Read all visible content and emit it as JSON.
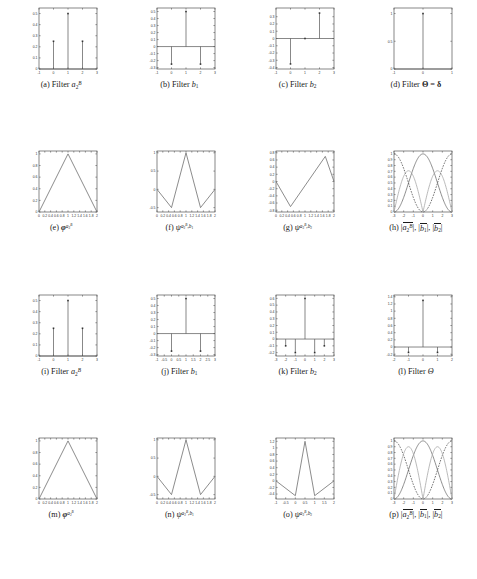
{
  "figure": {
    "rows": 4,
    "cols": 4,
    "colors": {
      "axis": "#555555",
      "stem": "#555555",
      "marker": "#333333",
      "curve_solid": "#6f6f6f",
      "curve_dashed": "#4a4a4a",
      "curve_light": "#a8a8a8",
      "background": "#ffffff"
    }
  },
  "chart_data": [
    {
      "id": "a",
      "type": "bar",
      "plot_style": "stem",
      "title": "",
      "caption_label": "(a)",
      "caption_text": "Filter a_2^B",
      "xlabel": "",
      "ylabel": "",
      "xlim": [
        -1,
        3
      ],
      "ylim": [
        0,
        0.55
      ],
      "xticks": [
        -1,
        0,
        1,
        2,
        3
      ],
      "xticklabels": [
        "-1",
        "0",
        "1",
        "2",
        "3"
      ],
      "yticks": [
        0,
        0.1,
        0.2,
        0.3,
        0.4,
        0.5
      ],
      "yticklabels": [
        "0",
        "0.1",
        "0.2",
        "0.3",
        "0.4",
        "0.5"
      ],
      "x": [
        0,
        1,
        2
      ],
      "values": [
        0.25,
        0.5,
        0.25
      ],
      "grid": false
    },
    {
      "id": "b",
      "type": "bar",
      "plot_style": "stem",
      "caption_label": "(b)",
      "caption_text": "Filter b_1",
      "xlim": [
        -1,
        3
      ],
      "ylim": [
        -0.32,
        0.55
      ],
      "xticks": [
        -1,
        0,
        1,
        2,
        3
      ],
      "xticklabels": [
        "-1",
        "0",
        "1",
        "2",
        "3"
      ],
      "yticks": [
        -0.3,
        -0.2,
        -0.1,
        0,
        0.1,
        0.2,
        0.3,
        0.4,
        0.5
      ],
      "yticklabels": [
        "-0.3",
        "-0.2",
        "-0.1",
        "0",
        "0.1",
        "0.2",
        "0.3",
        "0.4",
        "0.5"
      ],
      "x": [
        0,
        1,
        2
      ],
      "values": [
        -0.25,
        0.5,
        -0.25
      ],
      "grid": false
    },
    {
      "id": "c",
      "type": "bar",
      "plot_style": "stem",
      "caption_label": "(c)",
      "caption_text": "Filter b_2",
      "xlim": [
        -1,
        3
      ],
      "ylim": [
        -0.42,
        0.42
      ],
      "xticks": [
        -1,
        0,
        1,
        2,
        3
      ],
      "xticklabels": [
        "-1",
        "0",
        "1",
        "2",
        "3"
      ],
      "yticks": [
        -0.4,
        -0.3,
        -0.2,
        -0.1,
        0,
        0.1,
        0.2,
        0.3
      ],
      "yticklabels": [
        "-0.4",
        "-0.3",
        "-0.2",
        "-0.1",
        "0",
        "0.1",
        "0.2",
        "0.3"
      ],
      "x": [
        0,
        1,
        2
      ],
      "values": [
        -0.35,
        0,
        0.35
      ],
      "grid": false
    },
    {
      "id": "d",
      "type": "bar",
      "plot_style": "stem",
      "caption_label": "(d)",
      "caption_text": "Filter Theta = delta",
      "xlim": [
        -1,
        1
      ],
      "ylim": [
        0,
        1.1
      ],
      "xticks": [
        -1,
        0,
        1
      ],
      "xticklabels": [
        "-1",
        "0",
        "1"
      ],
      "yticks": [
        0,
        0.5,
        1
      ],
      "yticklabels": [
        "0",
        "0.5",
        "1"
      ],
      "x": [
        0
      ],
      "values": [
        1
      ],
      "grid": false
    },
    {
      "id": "e",
      "type": "line",
      "plot_style": "line",
      "caption_label": "(e)",
      "caption_text": "phi^{a_2^B}",
      "xlim": [
        0,
        2
      ],
      "ylim": [
        0,
        1.05
      ],
      "xticks": [
        0,
        0.2,
        0.4,
        0.6,
        0.8,
        1,
        1.2,
        1.4,
        1.6,
        1.8,
        2
      ],
      "xticklabels": [
        "0",
        "0.2",
        "0.4",
        "0.6",
        "0.8",
        "1",
        "1.2",
        "1.4",
        "1.6",
        "1.8",
        "2"
      ],
      "yticks": [
        0,
        0.2,
        0.4,
        0.6,
        0.8,
        1
      ],
      "yticklabels": [
        "0",
        "0.2",
        "0.4",
        "0.6",
        "0.8",
        "1"
      ],
      "x": [
        0,
        1,
        2
      ],
      "values": [
        0,
        1,
        0
      ],
      "grid": false
    },
    {
      "id": "f",
      "type": "line",
      "plot_style": "line",
      "caption_label": "(f)",
      "caption_text": "psi^{a_2^B, b_1}",
      "xlim": [
        0,
        2
      ],
      "ylim": [
        -0.62,
        1.05
      ],
      "xticks": [
        0,
        0.2,
        0.4,
        0.6,
        0.8,
        1,
        1.2,
        1.4,
        1.6,
        1.8,
        2
      ],
      "xticklabels": [
        "0",
        "0.2",
        "0.4",
        "0.6",
        "0.8",
        "1",
        "1.2",
        "1.4",
        "1.6",
        "1.8",
        "2"
      ],
      "yticks": [
        -0.5,
        0,
        0.5,
        1
      ],
      "yticklabels": [
        "-0.5",
        "0",
        "0.5",
        "1"
      ],
      "x": [
        0,
        0.5,
        1,
        1.5,
        2
      ],
      "values": [
        0,
        -0.5,
        1,
        -0.5,
        0
      ],
      "grid": false
    },
    {
      "id": "g",
      "type": "line",
      "plot_style": "line",
      "caption_label": "(g)",
      "caption_text": "psi^{a_2^B, b_2}",
      "xlim": [
        0,
        2
      ],
      "ylim": [
        -0.85,
        0.85
      ],
      "xticks": [
        0,
        0.2,
        0.4,
        0.6,
        0.8,
        1,
        1.2,
        1.4,
        1.6,
        1.8,
        2
      ],
      "xticklabels": [
        "0",
        "0.2",
        "0.4",
        "0.6",
        "0.8",
        "1",
        "1.2",
        "1.4",
        "1.6",
        "1.8",
        "2"
      ],
      "yticks": [
        -0.8,
        -0.6,
        -0.4,
        -0.2,
        0,
        0.2,
        0.4,
        0.6,
        0.8
      ],
      "yticklabels": [
        "-0.8",
        "-0.6",
        "-0.4",
        "-0.2",
        "0",
        "0.2",
        "0.4",
        "0.6",
        "0.8"
      ],
      "x": [
        0,
        0.5,
        1.7,
        2
      ],
      "values": [
        0,
        -0.7,
        0.7,
        0
      ],
      "grid": false
    },
    {
      "id": "h",
      "type": "line",
      "plot_style": "freq",
      "caption_label": "(h)",
      "caption_text": "|a_2^B|, |b_1|, |b_2|",
      "xlim": [
        -3,
        3
      ],
      "ylim": [
        0,
        1.05
      ],
      "xticks": [
        -3,
        -2,
        -1,
        0,
        1,
        2,
        3
      ],
      "xticklabels": [
        "-3",
        "-2",
        "-1",
        "0",
        "1",
        "2",
        "3"
      ],
      "yticks": [
        0,
        0.1,
        0.2,
        0.3,
        0.4,
        0.5,
        0.6,
        0.7,
        0.8,
        0.9,
        1
      ],
      "yticklabels": [
        "0",
        "0.1",
        "0.2",
        "0.3",
        "0.4",
        "0.5",
        "0.6",
        "0.7",
        "0.8",
        "0.9",
        "1"
      ],
      "series": [
        {
          "name": "|a_2^B|",
          "style": "solid",
          "color": "#6f6f6f",
          "fn": "cos2",
          "period": 6.2832,
          "peak_at": 0,
          "amp": 1
        },
        {
          "name": "|b_1|",
          "style": "dashed",
          "color": "#4a4a4a",
          "fn": "sin2",
          "period": 6.2832,
          "peak_at": 3,
          "amp": 1
        },
        {
          "name": "|b_2|",
          "style": "solid-light",
          "color": "#a8a8a8",
          "fn": "sin_abs",
          "period": 3.1416,
          "peak_at": 1.5708,
          "amp": 0.71
        }
      ],
      "grid": false
    },
    {
      "id": "i",
      "type": "bar",
      "plot_style": "stem",
      "caption_label": "(i)",
      "caption_text": "Filter a_2^B",
      "xlim": [
        -1,
        3
      ],
      "ylim": [
        0,
        0.55
      ],
      "xticks": [
        -1,
        0,
        1,
        2,
        3
      ],
      "xticklabels": [
        "-1",
        "0",
        "1",
        "2",
        "3"
      ],
      "yticks": [
        0,
        0.1,
        0.2,
        0.3,
        0.4,
        0.5
      ],
      "yticklabels": [
        "0",
        "0.1",
        "0.2",
        "0.3",
        "0.4",
        "0.5"
      ],
      "x": [
        0,
        1,
        2
      ],
      "values": [
        0.25,
        0.5,
        0.25
      ],
      "grid": false
    },
    {
      "id": "j",
      "type": "bar",
      "plot_style": "stem",
      "caption_label": "(j)",
      "caption_text": "Filter b_1",
      "xlim": [
        -1,
        3
      ],
      "ylim": [
        -0.32,
        0.55
      ],
      "xticks": [
        -1,
        -0.5,
        0,
        0.5,
        1,
        1.5,
        2,
        2.5,
        3
      ],
      "xticklabels": [
        "-1",
        "-0.5",
        "0",
        "0.5",
        "1",
        "1.5",
        "2",
        "2.5",
        "3"
      ],
      "yticks": [
        -0.3,
        -0.2,
        -0.1,
        0,
        0.1,
        0.2,
        0.3,
        0.4,
        0.5
      ],
      "yticklabels": [
        "-0.3",
        "-0.2",
        "-0.1",
        "0",
        "0.1",
        "0.2",
        "0.3",
        "0.4",
        "0.5"
      ],
      "x": [
        0,
        1,
        2
      ],
      "values": [
        -0.25,
        0.5,
        -0.25
      ],
      "grid": false
    },
    {
      "id": "k",
      "type": "bar",
      "plot_style": "stem",
      "caption_label": "(k)",
      "caption_text": "Filter b_2",
      "xlim": [
        -3,
        3
      ],
      "ylim": [
        -0.25,
        0.65
      ],
      "xticks": [
        -3,
        -2,
        -1,
        0,
        1,
        2,
        3
      ],
      "xticklabels": [
        "-3",
        "-2",
        "-1",
        "0",
        "1",
        "2",
        "3"
      ],
      "yticks": [
        -0.2,
        -0.1,
        0,
        0.1,
        0.2,
        0.3,
        0.4,
        0.5,
        0.6
      ],
      "yticklabels": [
        "-0.2",
        "-0.1",
        "0",
        "0.1",
        "0.2",
        "0.3",
        "0.4",
        "0.5",
        "0.6"
      ],
      "x": [
        -2,
        -1,
        0,
        1,
        2
      ],
      "values": [
        -0.1,
        -0.2,
        0.6,
        -0.2,
        -0.1
      ],
      "grid": false
    },
    {
      "id": "l",
      "type": "bar",
      "plot_style": "stem",
      "caption_label": "(l)",
      "caption_text": "Filter Theta",
      "xlim": [
        -2,
        2
      ],
      "ylim": [
        -0.25,
        1.45
      ],
      "xticks": [
        -2,
        -1,
        0,
        1,
        2
      ],
      "xticklabels": [
        "-2",
        "-1",
        "0",
        "1",
        "2"
      ],
      "yticks": [
        -0.2,
        0,
        0.2,
        0.4,
        0.6,
        0.8,
        1,
        1.2,
        1.4
      ],
      "yticklabels": [
        "-0.2",
        "0",
        "0.2",
        "0.4",
        "0.6",
        "0.8",
        "1",
        "1.2",
        "1.4"
      ],
      "x": [
        -1,
        0,
        1
      ],
      "values": [
        -0.15,
        1.3,
        -0.15
      ],
      "grid": false
    },
    {
      "id": "m",
      "type": "line",
      "plot_style": "line",
      "caption_label": "(m)",
      "caption_text": "phi^{a_2^B}",
      "xlim": [
        0,
        2
      ],
      "ylim": [
        0,
        1.05
      ],
      "xticks": [
        0,
        0.2,
        0.4,
        0.6,
        0.8,
        1,
        1.2,
        1.4,
        1.6,
        1.8,
        2
      ],
      "xticklabels": [
        "0",
        "0.2",
        "0.4",
        "0.6",
        "0.8",
        "1",
        "1.2",
        "1.4",
        "1.6",
        "1.8",
        "2"
      ],
      "yticks": [
        0,
        0.2,
        0.4,
        0.6,
        0.8,
        1
      ],
      "yticklabels": [
        "0",
        "0.2",
        "0.4",
        "0.6",
        "0.8",
        "1"
      ],
      "x": [
        0,
        1,
        2
      ],
      "values": [
        0,
        1,
        0
      ],
      "grid": false
    },
    {
      "id": "n",
      "type": "line",
      "plot_style": "line",
      "caption_label": "(n)",
      "caption_text": "psi^{a_2^B, b_1}",
      "xlim": [
        0,
        2
      ],
      "ylim": [
        -0.62,
        1.05
      ],
      "xticks": [
        0,
        0.2,
        0.4,
        0.6,
        0.8,
        1,
        1.2,
        1.4,
        1.6,
        1.8,
        2
      ],
      "xticklabels": [
        "0",
        "0.2",
        "0.4",
        "0.6",
        "0.8",
        "1",
        "1.2",
        "1.4",
        "1.6",
        "1.8",
        "2"
      ],
      "yticks": [
        -0.5,
        0,
        0.5,
        1
      ],
      "yticklabels": [
        "-0.5",
        "0",
        "0.5",
        "1"
      ],
      "x": [
        0,
        0.5,
        1,
        1.5,
        2
      ],
      "values": [
        0,
        -0.5,
        1,
        -0.5,
        0
      ],
      "grid": false
    },
    {
      "id": "o",
      "type": "line",
      "plot_style": "line",
      "caption_label": "(o)",
      "caption_text": "psi^{a_2^B, b_2}",
      "xlim": [
        -1,
        2
      ],
      "ylim": [
        -0.55,
        1.3
      ],
      "xticks": [
        -1,
        -0.5,
        0,
        0.5,
        1,
        1.5,
        2
      ],
      "xticklabels": [
        "-1",
        "-0.5",
        "0",
        "0.5",
        "1",
        "1.5",
        "2"
      ],
      "yticks": [
        -0.4,
        -0.2,
        0,
        0.2,
        0.4,
        0.6,
        0.8,
        1,
        1.2
      ],
      "yticklabels": [
        "-0.4",
        "-0.2",
        "0",
        "0.2",
        "0.4",
        "0.6",
        "0.8",
        "1",
        "1.2"
      ],
      "x": [
        -1,
        0,
        0.5,
        1,
        2
      ],
      "values": [
        0,
        -0.45,
        1.2,
        -0.45,
        0
      ],
      "grid": false
    },
    {
      "id": "p",
      "type": "line",
      "plot_style": "freq",
      "caption_label": "(p)",
      "caption_text": "|a_2^B|, |b_1|, |b_2|",
      "xlim": [
        -3,
        3
      ],
      "ylim": [
        0,
        1.05
      ],
      "xticks": [
        -3,
        -2,
        -1,
        0,
        1,
        2,
        3
      ],
      "xticklabels": [
        "-3",
        "-2",
        "-1",
        "0",
        "1",
        "2",
        "3"
      ],
      "yticks": [
        0,
        0.1,
        0.2,
        0.3,
        0.4,
        0.5,
        0.6,
        0.7,
        0.8,
        0.9,
        1
      ],
      "yticklabels": [
        "0",
        "0.1",
        "0.2",
        "0.3",
        "0.4",
        "0.5",
        "0.6",
        "0.7",
        "0.8",
        "0.9",
        "1"
      ],
      "series": [
        {
          "name": "|a_2^B|",
          "style": "solid",
          "color": "#6f6f6f",
          "fn": "cos2",
          "period": 6.2832,
          "peak_at": 0,
          "amp": 1
        },
        {
          "name": "|b_1|",
          "style": "dashed",
          "color": "#4a4a4a",
          "fn": "sin2",
          "period": 6.2832,
          "peak_at": 3,
          "amp": 1
        },
        {
          "name": "|b_2|",
          "style": "solid-light",
          "color": "#a8a8a8",
          "fn": "sin_abs",
          "period": 3.1416,
          "peak_at": 1.5708,
          "amp": 0.9
        }
      ],
      "grid": false
    }
  ],
  "captions": {
    "a": {
      "label": "(a)",
      "body": "Filter",
      "sym": "a",
      "sub": "2",
      "sup": "B"
    },
    "b": {
      "label": "(b)",
      "body": "Filter",
      "sym": "b",
      "sub": "1",
      "sup": ""
    },
    "c": {
      "label": "(c)",
      "body": "Filter",
      "sym": "b",
      "sub": "2",
      "sup": ""
    },
    "d": {
      "label": "(d)",
      "body": "Filter",
      "sym": "Θ = δ",
      "sub": "",
      "sup": ""
    },
    "e": {
      "label": "(e)",
      "body": "",
      "sym": "φ",
      "sub": "",
      "sup": "aB2"
    },
    "f": {
      "label": "(f)",
      "body": "",
      "sym": "ψ",
      "sub": "",
      "sup": "aB2,b1"
    },
    "g": {
      "label": "(g)",
      "body": "",
      "sym": "ψ",
      "sub": "",
      "sup": "aB2,b2"
    },
    "h": {
      "label": "(h)",
      "body": "",
      "sym": "",
      "sub": "",
      "sup": ""
    },
    "i": {
      "label": "(i)",
      "body": "Filter",
      "sym": "a",
      "sub": "2",
      "sup": "B"
    },
    "j": {
      "label": "(j)",
      "body": "Filter",
      "sym": "b",
      "sub": "1",
      "sup": ""
    },
    "k": {
      "label": "(k)",
      "body": "Filter",
      "sym": "b",
      "sub": "2",
      "sup": ""
    },
    "l": {
      "label": "(l)",
      "body": "Filter",
      "sym": "Θ",
      "sub": "",
      "sup": ""
    },
    "m": {
      "label": "(m)",
      "body": "",
      "sym": "φ",
      "sub": "",
      "sup": "aB2"
    },
    "n": {
      "label": "(n)",
      "body": "",
      "sym": "ψ",
      "sub": "",
      "sup": "aB2,b1"
    },
    "o": {
      "label": "(o)",
      "body": "",
      "sym": "ψ",
      "sub": "",
      "sup": "aB2,b2"
    },
    "p": {
      "label": "(p)",
      "body": "",
      "sym": "",
      "sub": "",
      "sup": ""
    }
  }
}
